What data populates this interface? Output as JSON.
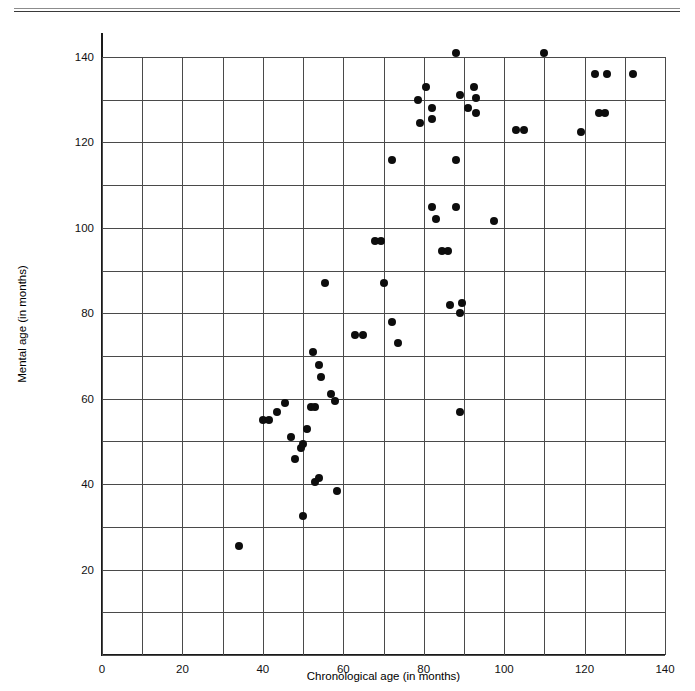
{
  "figure": {
    "has_top_rule": true
  },
  "chart_data": {
    "type": "scatter",
    "title": "",
    "xlabel": "Chronological age (in months)",
    "ylabel": "Mental age (in months)",
    "xlim": [
      0,
      140
    ],
    "ylim": [
      0,
      140
    ],
    "x_ticks": [
      0,
      20,
      40,
      60,
      80,
      100,
      120,
      140
    ],
    "x_tick_labels": [
      "0",
      "20",
      "40",
      "60",
      "80",
      "100",
      "120",
      "140"
    ],
    "y_ticks": [
      20,
      40,
      60,
      80,
      100,
      120,
      140
    ],
    "y_tick_labels": [
      "20",
      "40",
      "60",
      "80",
      "100",
      "120",
      "140"
    ],
    "grid": true,
    "grid_step_x": 10,
    "grid_step_y": 10,
    "legend": "none",
    "marker": "filled-circle",
    "marker_color": "#0d0d0d",
    "n_points": 63,
    "points": [
      [
        34,
        25.5
      ],
      [
        40,
        55
      ],
      [
        41.5,
        55
      ],
      [
        43.5,
        57
      ],
      [
        45.5,
        59
      ],
      [
        47,
        51
      ],
      [
        48,
        46
      ],
      [
        49.5,
        48.5
      ],
      [
        50,
        49.5
      ],
      [
        50,
        32.5
      ],
      [
        51,
        53
      ],
      [
        52,
        58
      ],
      [
        53,
        58
      ],
      [
        53,
        40.5
      ],
      [
        54,
        41.5
      ],
      [
        54.5,
        65
      ],
      [
        54,
        68
      ],
      [
        52.5,
        71
      ],
      [
        55.5,
        87
      ],
      [
        57,
        61
      ],
      [
        58.5,
        38.5
      ],
      [
        58,
        59.5
      ],
      [
        63,
        75
      ],
      [
        65,
        75
      ],
      [
        68,
        97
      ],
      [
        69.5,
        97
      ],
      [
        70,
        87
      ],
      [
        72,
        78
      ],
      [
        72,
        116
      ],
      [
        73.5,
        73
      ],
      [
        78.5,
        130
      ],
      [
        79,
        124.5
      ],
      [
        80.5,
        133
      ],
      [
        82,
        125.5
      ],
      [
        82,
        128
      ],
      [
        82,
        105
      ],
      [
        83,
        102
      ],
      [
        84.5,
        94.5
      ],
      [
        86,
        94.5
      ],
      [
        86.5,
        82
      ],
      [
        88,
        141
      ],
      [
        88,
        116
      ],
      [
        88,
        105
      ],
      [
        89,
        131
      ],
      [
        89,
        80
      ],
      [
        89.5,
        82.5
      ],
      [
        89,
        57
      ],
      [
        91,
        128
      ],
      [
        92.5,
        133
      ],
      [
        93,
        130.5
      ],
      [
        93,
        127
      ],
      [
        97.5,
        101.5
      ],
      [
        103,
        123
      ],
      [
        105,
        123
      ],
      [
        110,
        141
      ],
      [
        119,
        122.5
      ],
      [
        122.5,
        136
      ],
      [
        123.5,
        127
      ],
      [
        125,
        127
      ],
      [
        125.5,
        136
      ],
      [
        132,
        136
      ]
    ]
  }
}
